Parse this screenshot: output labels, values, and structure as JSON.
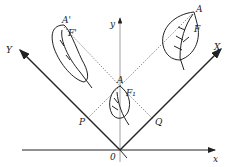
{
  "diagram": {
    "type": "coordinate rotation with leaf figures",
    "axes": {
      "x": "x",
      "y": "y",
      "X": "X",
      "Y": "Y",
      "origin": "0"
    },
    "points": {
      "A": "A",
      "A_prime": "A'",
      "A1": "A",
      "P": "P",
      "Q": "Q"
    },
    "figures": {
      "F": "F",
      "F_prime": "F'",
      "F1": "F₁"
    }
  }
}
